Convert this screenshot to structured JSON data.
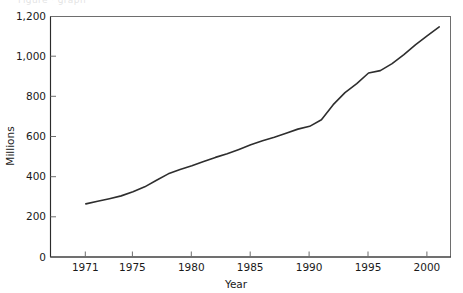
{
  "figure": {
    "background_color": "#ffffff",
    "line_color": "#2e2e2e",
    "axis_color": "#2b2b2b",
    "frame_color": "#6e6e6e",
    "top_cropped_text": "Figure · graph"
  },
  "chart_data": {
    "type": "line",
    "title": "",
    "subtitle": "",
    "xlabel": "Year",
    "ylabel": "Millions",
    "xlim": [
      1968,
      2002
    ],
    "ylim": [
      0,
      1200
    ],
    "grid": false,
    "legend": null,
    "x_tick_labels": [
      "1971",
      "1975",
      "1980",
      "1985",
      "1990",
      "1995",
      "2000"
    ],
    "x_tick_values": [
      1971,
      1975,
      1980,
      1985,
      1990,
      1995,
      2000
    ],
    "y_tick_labels": [
      "0",
      "200",
      "400",
      "600",
      "800",
      "1,000",
      "1,200"
    ],
    "y_tick_values": [
      0,
      200,
      400,
      600,
      800,
      1000,
      1200
    ],
    "series": [
      {
        "name": "Millions",
        "x": [
          1971,
          1972,
          1973,
          1974,
          1975,
          1976,
          1977,
          1978,
          1979,
          1980,
          1981,
          1982,
          1983,
          1984,
          1985,
          1986,
          1987,
          1988,
          1989,
          1990,
          1991,
          1992,
          1993,
          1994,
          1995,
          1996,
          1997,
          1998,
          1999,
          2000,
          2001
        ],
        "values": [
          265,
          278,
          291,
          305,
          325,
          350,
          383,
          415,
          437,
          455,
          477,
          497,
          515,
          537,
          560,
          580,
          598,
          618,
          638,
          652,
          685,
          760,
          820,
          865,
          918,
          930,
          965,
          1010,
          1060,
          1105,
          1148
        ],
        "first_value": 265,
        "last_value": 1148,
        "min_value": 265,
        "max_value": 1148
      }
    ]
  }
}
